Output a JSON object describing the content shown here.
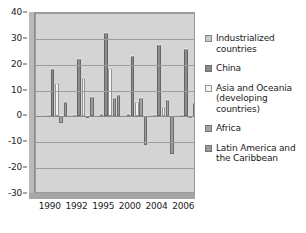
{
  "chart_data": {
    "type": "bar",
    "title": "",
    "subtitle": "",
    "xlabel": "",
    "ylabel": "",
    "ylim": [
      -30,
      40
    ],
    "ytick_step": 10,
    "grid": true,
    "legend_position": "right",
    "categories": [
      "1990",
      "1992",
      "1995",
      "2000",
      "2004",
      "2006"
    ],
    "yticks": [
      "40",
      "30",
      "20",
      "10",
      "0",
      "-10",
      "-20",
      "-30"
    ],
    "series": [
      {
        "name": "Industrialized countries",
        "color": "#c9c9c9",
        "values": [
          0.4,
          0.6,
          1.0,
          0.8,
          0.5,
          0.4
        ]
      },
      {
        "name": "China",
        "color": "#8c8c8c",
        "values": [
          18.3,
          22.4,
          32.3,
          23.3,
          27.8,
          25.9
        ]
      },
      {
        "name": "Asia and Oceania (developing countries)",
        "color": "#f2f2f2",
        "values": [
          13.1,
          14.8,
          18.7,
          5.5,
          3.8,
          0.3
        ]
      },
      {
        "name": "Africa",
        "color": "#a3a3a3",
        "values": [
          -2.4,
          -0.8,
          7.3,
          7.0,
          6.3,
          5.2
        ]
      },
      {
        "name": "Latin America and the Caribbean",
        "color": "#9b9b9b",
        "values": [
          5.6,
          7.5,
          8.1,
          -11.2,
          -14.6,
          -28.7
        ]
      }
    ]
  },
  "legend": {
    "items": [
      {
        "label": "Industrialized\ncountries"
      },
      {
        "label": "China"
      },
      {
        "label": "Asia and Oceania\n(developing\ncountries)"
      },
      {
        "label": "Africa"
      },
      {
        "label": "Latin America and\nthe Caribbean"
      }
    ]
  }
}
